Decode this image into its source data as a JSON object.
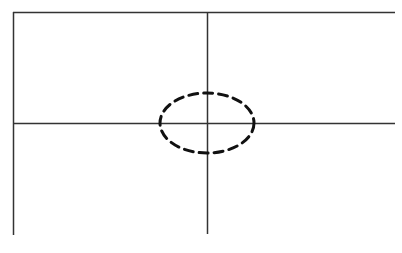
{
  "diagram": {
    "type": "quadrant-axes-with-dashed-ellipse",
    "background": "#ffffff",
    "line_color": "#333333",
    "ellipse_color": "#111111",
    "lines": {
      "left_vertical": {
        "x1": 13.5,
        "y1": 12,
        "x2": 13.5,
        "y2": 235
      },
      "top_horizontal": {
        "x1": 13,
        "y1": 12.5,
        "x2": 395,
        "y2": 12.5
      },
      "middle_horizontal": {
        "x1": 13,
        "y1": 123.5,
        "x2": 395,
        "y2": 123.5
      },
      "center_vertical": {
        "x1": 207.5,
        "y1": 12,
        "x2": 207.5,
        "y2": 234
      }
    },
    "ellipse": {
      "cx": 207,
      "cy": 123,
      "rx": 47,
      "ry": 30,
      "dash": "9 6",
      "stroke_width": 3
    }
  }
}
